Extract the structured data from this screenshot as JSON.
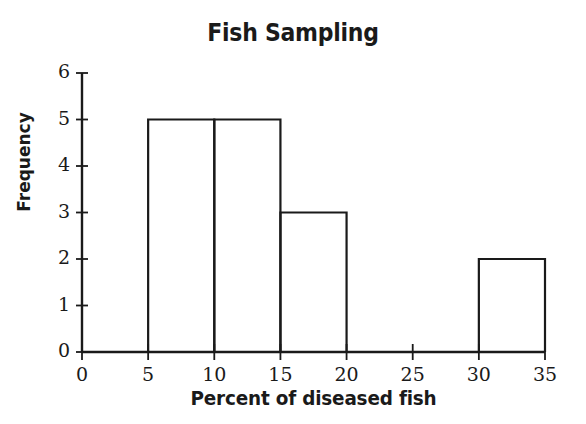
{
  "chart_data": {
    "type": "bar",
    "title": "Fish Sampling",
    "xlabel": "Percent of diseased fish",
    "ylabel": "Frequency",
    "subtitle": "",
    "grid": false,
    "legend": false,
    "legend_position": "none",
    "bar_style": "histogram-outline-unfilled",
    "bin_width": 5,
    "xlim": [
      0,
      35
    ],
    "ylim": [
      0,
      6
    ],
    "x_ticks": [
      0,
      5,
      10,
      15,
      20,
      25,
      30,
      35
    ],
    "x_tick_labels": [
      "0",
      "5",
      "10",
      "15",
      "20",
      "25",
      "30",
      "35"
    ],
    "y_ticks": [
      0,
      1,
      2,
      3,
      4,
      5,
      6
    ],
    "y_tick_labels": [
      "0",
      "1",
      "2",
      "3",
      "4",
      "5",
      "6"
    ],
    "categories": [
      "0-5",
      "5-10",
      "10-15",
      "15-20",
      "20-25",
      "25-30",
      "30-35"
    ],
    "bin_edges": [
      0,
      5,
      10,
      15,
      20,
      25,
      30,
      35
    ],
    "values": [
      0,
      5,
      5,
      3,
      0,
      0,
      2
    ],
    "bars": [
      {
        "label": "5-10",
        "x0": 5,
        "x1": 10,
        "value": 5
      },
      {
        "label": "10-15",
        "x0": 10,
        "x1": 15,
        "value": 5
      },
      {
        "label": "15-20",
        "x0": 15,
        "x1": 20,
        "value": 3
      },
      {
        "label": "30-35",
        "x0": 30,
        "x1": 35,
        "value": 2
      }
    ],
    "colors": {
      "background": "#ffffff",
      "axis": "#1a1a1a",
      "bar_stroke": "#1a1a1a",
      "bar_fill": "none",
      "text": "#1a1a1a"
    }
  }
}
